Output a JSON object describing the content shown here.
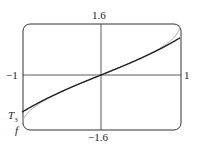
{
  "chart_data": {
    "type": "line",
    "title": "",
    "xlabel": "",
    "ylabel": "",
    "xlim": [
      -1,
      1
    ],
    "ylim": [
      -1.6,
      1.6
    ],
    "tick_labels": {
      "x_left": "-1",
      "x_right": "1",
      "y_top": "1.6",
      "y_bottom": "-1.6"
    },
    "series": [
      {
        "name": "f",
        "description": "arcsin(x), light gray curve",
        "x": [
          -1,
          -0.75,
          -0.5,
          -0.25,
          0,
          0.25,
          0.5,
          0.75,
          1
        ],
        "y": [
          -1.571,
          -0.848,
          -0.524,
          -0.253,
          0,
          0.253,
          0.524,
          0.848,
          1.571
        ]
      },
      {
        "name": "T3",
        "description": "x + x^3/6, dark curve",
        "x": [
          -1,
          -0.75,
          -0.5,
          -0.25,
          0,
          0.25,
          0.5,
          0.75,
          1
        ],
        "y": [
          -1.167,
          -0.82,
          -0.521,
          -0.253,
          0,
          0.253,
          0.521,
          0.82,
          1.167
        ]
      }
    ],
    "legend": [
      "T3",
      "f"
    ]
  },
  "labels": {
    "y_top": "1.6",
    "y_bottom": "−1.6",
    "x_left": "−1",
    "x_right": "1",
    "t3": "T",
    "t3_sub": "3",
    "f": "f"
  }
}
